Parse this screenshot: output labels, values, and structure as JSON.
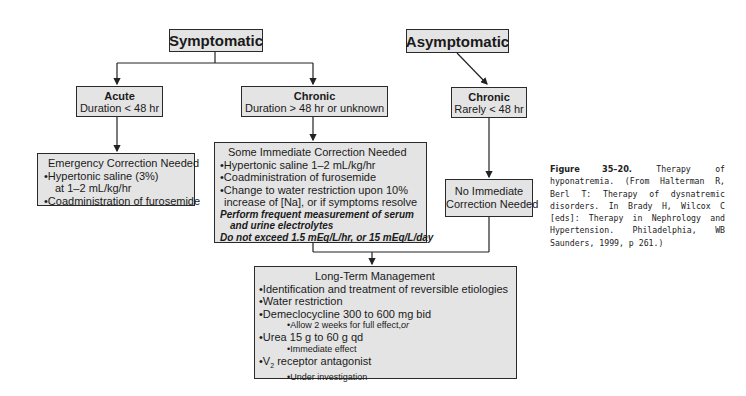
{
  "diagram": {
    "root_left": {
      "label": "Symptomatic"
    },
    "root_right": {
      "label": "Asymptomatic"
    },
    "acute": {
      "title": "Acute",
      "sub": "Duration < 48 hr"
    },
    "chronic_sym": {
      "title": "Chronic",
      "sub": "Duration > 48 hr or unknown"
    },
    "chronic_asym": {
      "title": "Chronic",
      "sub": "Rarely < 48 hr"
    },
    "emergency": {
      "title": "Emergency Correction Needed",
      "items": [
        "Hypertonic saline (3%)",
        "at 1–2 mL/kg/hr",
        "Coadministration of furosemide"
      ]
    },
    "some_immediate": {
      "title": "Some Immediate Correction Needed",
      "items": [
        "Hypertonic saline 1–2 mL/kg/hr",
        "Coadministration of furosemide",
        "Change to water restriction upon 10%",
        "increase of [Na], or if symptoms resolve"
      ],
      "notes": [
        "Perform frequent measurement of serum",
        "and urine electrolytes",
        "Do not exceed 1.5 mEq/L/hr, or 15 mEq/L/day"
      ]
    },
    "no_immediate": {
      "line1": "No Immediate",
      "line2": "Correction Needed"
    },
    "long_term": {
      "title": "Long-Term Management",
      "items": [
        "Identification and treatment of reversible etiologies",
        "Water restriction",
        "Demeclocycline 300 to 600 mg bid",
        "Allow 2 weeks for full effect,",
        "or",
        "Urea 15 g to 60 g qd",
        "Immediate effect",
        "V",
        "2",
        " receptor antagonist",
        "Under investigation"
      ]
    }
  },
  "caption": {
    "figure_label": "Figure 35–20.",
    "text": "Therapy of hyponatremia. (From Halterman R, Berl T: Therapy of dysnatremic disorders. In Brady H, Wilcox C [eds]: Therapy in Nephrology and Hypertension. Philadelphia, WB Saunders, 1999, p 261.)"
  }
}
